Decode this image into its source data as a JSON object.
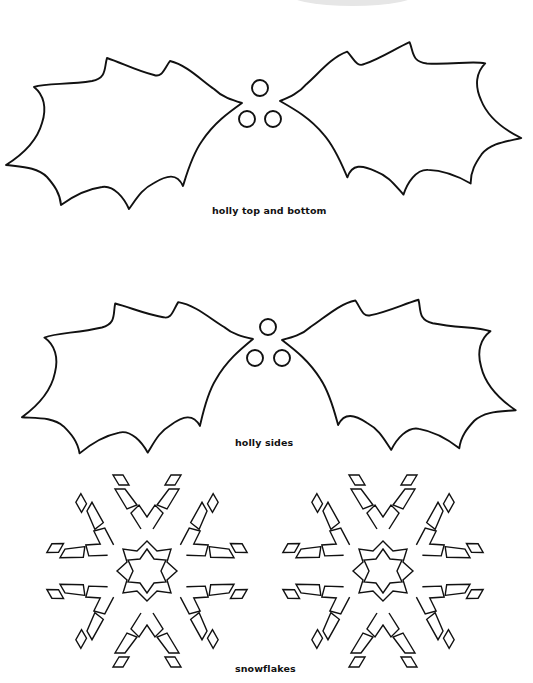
{
  "page": {
    "background": "#ffffff",
    "line_color": "#111111"
  },
  "templates": [
    {
      "id": "holly-top-bottom",
      "caption": "holly top and bottom",
      "leaves": 2,
      "berries": 3
    },
    {
      "id": "holly-sides",
      "caption": "holly sides",
      "leaves": 2,
      "berries": 3
    },
    {
      "id": "snowflakes",
      "caption": "snowflakes",
      "count": 2
    }
  ]
}
